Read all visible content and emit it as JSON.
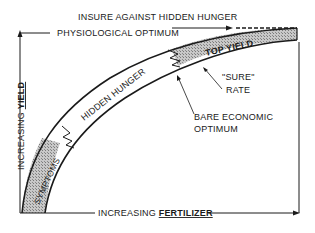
{
  "diagram": {
    "labels": {
      "top_title": "INSURE AGAINST HIDDEN HUNGER",
      "physiological_optimum": "PHYSIOLOGICAL OPTIMUM",
      "top_yield": "TOP YIELD",
      "hidden_hunger": "HIDDEN HUNGER",
      "symptoms": "SYMPTOMS",
      "sure_rate_line1": "\"SURE\"",
      "sure_rate_line2": "RATE",
      "bare_optimum_line1": "BARE ECONOMIC",
      "bare_optimum_line2": "OPTIMUM",
      "y_axis_prefix": "INCREASING ",
      "y_axis_key": "YIELD",
      "x_axis_prefix": "INCREASING ",
      "x_axis_key": "FERTILIZER"
    },
    "zones": [
      "SYMPTOMS",
      "HIDDEN HUNGER",
      "TOP YIELD"
    ],
    "colors": {
      "ink": "#1a1a1a",
      "shade": "#b5b5b5",
      "background": "#ffffff"
    }
  }
}
